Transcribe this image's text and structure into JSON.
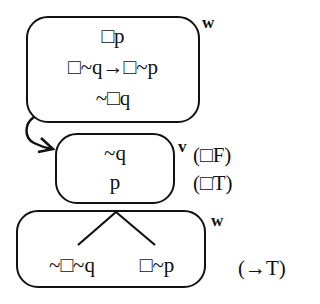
{
  "diagram": {
    "type": "modal-logic-tableau",
    "nodes": [
      {
        "id": "box-1",
        "world": "w",
        "lines": [
          "□p",
          "□~q→□~p",
          "~□q"
        ]
      },
      {
        "id": "box-2",
        "world": "v",
        "lines": [
          "~q",
          "p"
        ],
        "rules": [
          "(□F)",
          "(□T)"
        ]
      },
      {
        "id": "box-3",
        "world": "w",
        "branches": [
          "~□~q",
          "□~p"
        ],
        "rule": "(→T)"
      }
    ],
    "edges": [
      {
        "from": "box-1",
        "to": "box-2",
        "style": "curved-arrow"
      }
    ]
  }
}
